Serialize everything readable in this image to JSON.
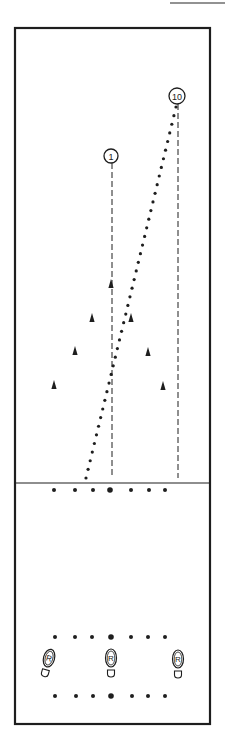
{
  "colors": {
    "ink": "#1e1e1e",
    "paper": "#ffffff",
    "rule": "#6e6e6e"
  },
  "top_rule": {
    "x1": 170,
    "x2": 225,
    "y": 3
  },
  "court": {
    "x": 15,
    "y": 28,
    "width": 195,
    "height": 696,
    "divider_y": 483
  },
  "markers": [
    {
      "label": "1",
      "cx": 111,
      "cy": 156,
      "r": 7,
      "line_bottom": 478
    },
    {
      "label": "10",
      "cx": 177,
      "cy": 96,
      "r": 8,
      "line_bottom": 478
    }
  ],
  "run_path": {
    "x1": 176,
    "y1": 107,
    "x2": 86,
    "y2": 478,
    "dot_count": 44
  },
  "cones": [
    {
      "x": 111,
      "y": 284
    },
    {
      "x": 92,
      "y": 318
    },
    {
      "x": 131,
      "y": 318
    },
    {
      "x": 75,
      "y": 351
    },
    {
      "x": 148,
      "y": 352
    },
    {
      "x": 54,
      "y": 385
    },
    {
      "x": 163,
      "y": 386
    }
  ],
  "dot_rows": [
    {
      "y": 490,
      "xs": [
        54,
        75,
        93,
        110,
        131,
        149,
        165
      ],
      "big_index": 3
    },
    {
      "y": 637,
      "xs": [
        55,
        75,
        92,
        111,
        131,
        148,
        165
      ],
      "big_index": 3
    },
    {
      "y": 696,
      "xs": [
        55,
        76,
        93,
        111,
        132,
        148,
        165
      ],
      "big_index": 3
    }
  ],
  "footprints": [
    {
      "label": "R",
      "cx": 48,
      "cy": 662,
      "rotate": 15
    },
    {
      "label": "R",
      "cx": 111,
      "cy": 662,
      "rotate": 0
    },
    {
      "label": "R",
      "cx": 178,
      "cy": 663,
      "rotate": 0
    }
  ]
}
